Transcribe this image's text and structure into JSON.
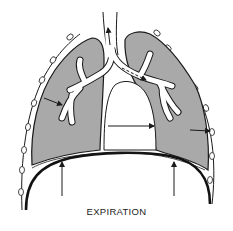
{
  "diagram": {
    "caption": "EXPIRATION",
    "colors": {
      "lung_fill": "#a9a9a9",
      "line": "#1a1a1a",
      "background": "#ffffff",
      "airway": "#ffffff"
    },
    "elements": [
      {
        "id": "trachea",
        "label": "trachea with upward airflow arrow"
      },
      {
        "id": "left-lung",
        "label": "left lung (shaded)"
      },
      {
        "id": "right-lung",
        "label": "right lung (shaded)"
      },
      {
        "id": "bronchial-tree",
        "label": "branching bronchi"
      },
      {
        "id": "diaphragm",
        "label": "diaphragm (thick curved line)"
      },
      {
        "id": "chest-wall-ribs",
        "label": "rib cross-sections along chest wall"
      },
      {
        "id": "heart-space",
        "label": "mediastinum / heart space"
      }
    ],
    "arrows": [
      {
        "id": "trachea-up",
        "direction": "up",
        "meaning": "air exits"
      },
      {
        "id": "bronchus-dashed",
        "direction": "down-right",
        "style": "dashed"
      },
      {
        "id": "left-lung-inward",
        "direction": "inward"
      },
      {
        "id": "mediastinum-right",
        "direction": "right"
      },
      {
        "id": "right-lung-outward",
        "direction": "right"
      },
      {
        "id": "diaphragm-left-up",
        "direction": "up"
      },
      {
        "id": "diaphragm-right-up",
        "direction": "up"
      }
    ]
  }
}
